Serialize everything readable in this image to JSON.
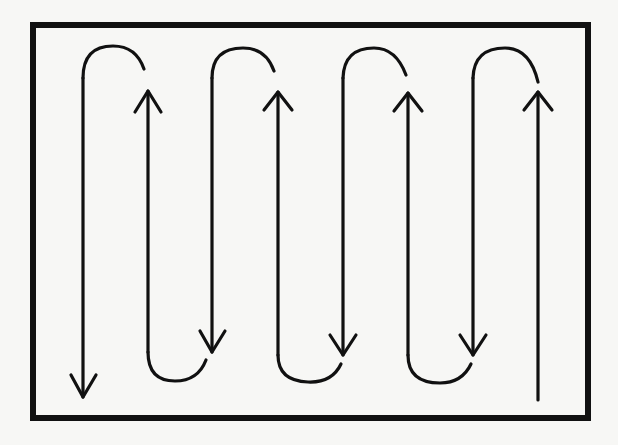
{
  "diagram": {
    "type": "serpentine-flow",
    "frame": {
      "x": 33,
      "y": 25,
      "width": 555,
      "height": 393
    },
    "colors": {
      "background": "#f7f7f5",
      "stroke": "#111111"
    },
    "columns_x": [
      83,
      148,
      212,
      278,
      343,
      408,
      473,
      538
    ],
    "start": {
      "x": 538,
      "y": 400,
      "direction": "up"
    },
    "end": {
      "x": 83,
      "y": 397,
      "direction": "down"
    },
    "segments": [
      {
        "x": 538,
        "direction": "up"
      },
      {
        "x": 473,
        "direction": "down"
      },
      {
        "x": 408,
        "direction": "up"
      },
      {
        "x": 343,
        "direction": "down"
      },
      {
        "x": 278,
        "direction": "up"
      },
      {
        "x": 212,
        "direction": "down"
      },
      {
        "x": 148,
        "direction": "up"
      },
      {
        "x": 83,
        "direction": "down"
      }
    ],
    "top_turns": 4,
    "bottom_turns": 3,
    "arrowheads": 8
  }
}
